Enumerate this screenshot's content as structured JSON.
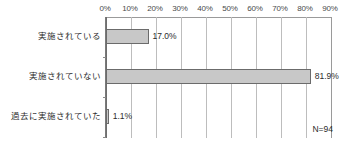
{
  "chart_data": {
    "type": "bar",
    "orientation": "horizontal",
    "title": "",
    "subtitle": "",
    "xlabel": "",
    "ylabel": "",
    "xlim": [
      0,
      90
    ],
    "grid": true,
    "legend": false,
    "categories": [
      "実施されている",
      "実施されていない",
      "過去に実施されていた"
    ],
    "values": [
      17.0,
      81.9,
      1.1
    ],
    "value_labels": [
      "17.0%",
      "81.9%",
      "1.1%"
    ],
    "tick_labels": [
      "0%",
      "10%",
      "20%",
      "30%",
      "40%",
      "50%",
      "60%",
      "70%",
      "80%",
      "90%"
    ],
    "tick_values": [
      0,
      10,
      20,
      30,
      40,
      50,
      60,
      70,
      80,
      90
    ],
    "annotations": [
      {
        "name": "sample-size",
        "text": "N=94"
      }
    ],
    "colors": {
      "bar_fill": "#c8c8c8",
      "bar_border": "#6b6b6b",
      "gridline": "#bdbdbd",
      "axis": "#6e6e6e",
      "text": "#2b2b2b",
      "tick_text": "#4a4a4a",
      "background": "#ffffff"
    }
  }
}
